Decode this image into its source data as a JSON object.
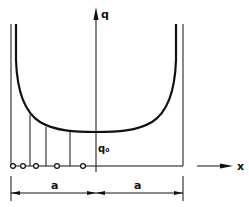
{
  "diagram": {
    "type": "contact-pressure-distribution",
    "axes": {
      "vertical_label": "q",
      "horizontal_label": "x"
    },
    "curve": {
      "min_value_label": "q₀",
      "shape": "U-shaped, singular at both ends"
    },
    "dimensions": [
      {
        "label": "a",
        "side": "left"
      },
      {
        "label": "a",
        "side": "right"
      }
    ],
    "markers": {
      "count": 5,
      "shape": "open-circle"
    },
    "colors": {
      "stroke": "#111111",
      "background": "#ffffff"
    }
  }
}
